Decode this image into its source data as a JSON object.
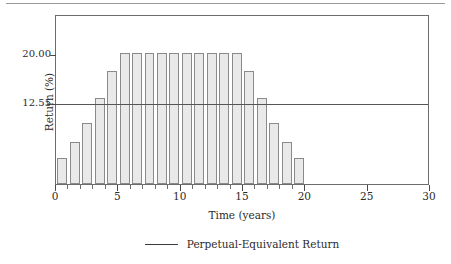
{
  "chart_data": {
    "type": "bar",
    "title": "",
    "xlabel": "Time (years)",
    "ylabel": "Return (%)",
    "xlim": [
      0,
      30
    ],
    "ylim": [
      0,
      26
    ],
    "grid": false,
    "x": [
      1,
      2,
      3,
      4,
      5,
      6,
      7,
      8,
      9,
      10,
      11,
      12,
      13,
      14,
      15,
      16,
      17,
      18,
      19,
      20
    ],
    "categories": [
      "1",
      "2",
      "3",
      "4",
      "5",
      "6",
      "7",
      "8",
      "9",
      "10",
      "11",
      "12",
      "13",
      "14",
      "15",
      "16",
      "17",
      "18",
      "19",
      "20"
    ],
    "values": [
      4.0,
      6.5,
      9.3,
      13.2,
      17.3,
      20.0,
      20.0,
      20.0,
      20.0,
      20.0,
      20.0,
      20.0,
      20.0,
      20.0,
      20.0,
      17.3,
      13.2,
      9.3,
      6.5,
      4.0
    ],
    "series": [
      {
        "name": "Return",
        "values": [
          4.0,
          6.5,
          9.3,
          13.2,
          17.3,
          20.0,
          20.0,
          20.0,
          20.0,
          20.0,
          20.0,
          20.0,
          20.0,
          20.0,
          20.0,
          17.3,
          13.2,
          9.3,
          6.5,
          4.0
        ]
      }
    ],
    "x_ticks": [
      0,
      5,
      10,
      15,
      20,
      25,
      30
    ],
    "x_tick_labels": [
      "0",
      "5",
      "10",
      "15",
      "20",
      "25",
      "30"
    ],
    "x_minor_tick_step": 1,
    "y_ticks": [
      12.55,
      20.0
    ],
    "y_tick_labels": [
      "12.55",
      "20.00"
    ],
    "reference_lines": [
      {
        "name": "perpetual-equivalent-return",
        "value": 12.55,
        "label": "Perpetual-Equivalent Return"
      }
    ],
    "legend": {
      "position": "below",
      "entries": [
        {
          "label": "Perpetual-Equivalent Return",
          "marker": "line"
        }
      ]
    },
    "colors": {
      "bar_fill": "#e9e9e9",
      "bar_stroke": "#8a8a8a",
      "axis": "#6d6d6d",
      "reference_line": "#555555",
      "text": "#2b2b2b"
    }
  },
  "legend": {
    "entry_label": "Perpetual-Equivalent Return"
  },
  "axes": {
    "y_title": "Return (%)",
    "x_title": "Time (years)"
  }
}
